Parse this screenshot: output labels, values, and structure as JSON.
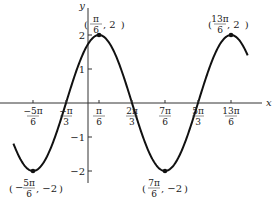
{
  "chart_data": {
    "type": "line",
    "title": "",
    "function": "y = 2 sin(x + π/3)",
    "xlabel": "x",
    "ylabel": "y",
    "x_ticks": [
      {
        "num": "−5π",
        "den": "6",
        "value": -2.618
      },
      {
        "num": "−π",
        "den": "3",
        "value": -1.047
      },
      {
        "num": "π",
        "den": "6",
        "value": 0.524
      },
      {
        "num": "2π",
        "den": "3",
        "value": 2.094
      },
      {
        "num": "7π",
        "den": "6",
        "value": 3.665
      },
      {
        "num": "5π",
        "den": "3",
        "value": 5.236
      },
      {
        "num": "13π",
        "den": "6",
        "value": 6.807
      }
    ],
    "y_ticks": [
      {
        "label": "2",
        "value": 2
      },
      {
        "label": "1",
        "value": 1
      },
      {
        "label": "−1",
        "value": -1
      },
      {
        "label": "−2",
        "value": -2
      }
    ],
    "ylim": [
      -2,
      2
    ],
    "xlim": [
      -3.4,
      7.3
    ],
    "grid": false,
    "annotations": [
      {
        "text_open": "(",
        "num": "π",
        "den": "6",
        "rest": ", 2)",
        "x": 0.524,
        "y": 2
      },
      {
        "text_open": "(",
        "num": "13π",
        "den": "6",
        "rest": ", 2)",
        "x": 6.807,
        "y": 2
      },
      {
        "text_open": "(−",
        "num": "5π",
        "den": "6",
        "rest": ", −2)",
        "x": -2.618,
        "y": -2
      },
      {
        "text_open": "(",
        "num": "7π",
        "den": "6",
        "rest": ", −2)",
        "x": 3.665,
        "y": -2
      }
    ],
    "key_points": [
      {
        "x": -2.618,
        "y": -2
      },
      {
        "x": -1.047,
        "y": 0
      },
      {
        "x": 0.524,
        "y": 2
      },
      {
        "x": 2.094,
        "y": 0
      },
      {
        "x": 3.665,
        "y": -2
      },
      {
        "x": 5.236,
        "y": 0
      },
      {
        "x": 6.807,
        "y": 2
      }
    ],
    "line_color": "#111111"
  }
}
